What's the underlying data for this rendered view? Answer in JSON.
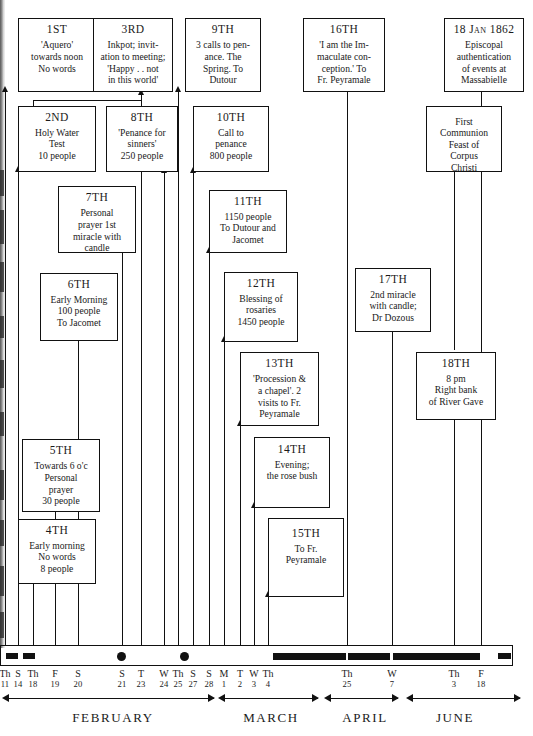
{
  "boxes": [
    {
      "name": "box-1st",
      "day": "1ST",
      "body": "'Aquero'\ntowards noon\nNo words"
    },
    {
      "name": "box-3rd",
      "day": "3RD",
      "body": "Inkpot; invit-\nation to meeting;\n'Happy . . not\nin this world'"
    },
    {
      "name": "box-9th",
      "day": "9TH",
      "body": "3 calls to pen-\nance. The\nSpring. To\nDutour"
    },
    {
      "name": "box-16th",
      "day": "16TH",
      "body": "'I am the Im-\nmaculate con-\nception.' To\nFr. Peyramale"
    },
    {
      "name": "box-18jan",
      "day": "18 Jan 1862",
      "body": "Episcopal\nauthentication\nof events at\nMassabielle"
    },
    {
      "name": "box-2nd",
      "day": "2ND",
      "body": "Holy Water\nTest\n10 people"
    },
    {
      "name": "box-8th",
      "day": "8TH",
      "body": "'Penance for\nsinners'\n250 people"
    },
    {
      "name": "box-10th",
      "day": "10TH",
      "body": "Call to\npenance\n800 people"
    },
    {
      "name": "box-first-communion",
      "day": "",
      "body": "First\nCommunion\nFeast of\nCorpus\nChristi"
    },
    {
      "name": "box-7th",
      "day": "7TH",
      "body": "Personal\nprayer 1st\nmiracle with\ncandle"
    },
    {
      "name": "box-11th",
      "day": "11TH",
      "body": "1150 people\nTo Dutour and\nJacomet"
    },
    {
      "name": "box-6th",
      "day": "6TH",
      "body": "Early Morning\n100 people\nTo Jacomet"
    },
    {
      "name": "box-12th",
      "day": "12TH",
      "body": "Blessing of\nrosaries\n1450 people"
    },
    {
      "name": "box-17th",
      "day": "17TH",
      "body": "2nd miracle\nwith candle;\nDr Dozous"
    },
    {
      "name": "box-13th",
      "day": "13TH",
      "body": "'Procession &\na chapel'. 2\nvisits to Fr.\nPeyramale"
    },
    {
      "name": "box-18th",
      "day": "18TH",
      "body": "8 pm\nRight bank\nof River Gave"
    },
    {
      "name": "box-14th",
      "day": "14TH",
      "body": "Evening;\nthe rose bush"
    },
    {
      "name": "box-5th",
      "day": "5TH",
      "body": "Towards 6 o'c\nPersonal\nprayer\n30 people"
    },
    {
      "name": "box-15th",
      "day": "15TH",
      "body": "To Fr.\nPeyramale"
    },
    {
      "name": "box-4th",
      "day": "4TH",
      "body": "Early morning\nNo words\n8 people"
    }
  ],
  "ticks": [
    {
      "dow": "Th",
      "num": "11"
    },
    {
      "dow": "S",
      "num": "14"
    },
    {
      "dow": "Th",
      "num": "18"
    },
    {
      "dow": "F",
      "num": "19"
    },
    {
      "dow": "S",
      "num": "20"
    },
    {
      "dow": "S",
      "num": "21"
    },
    {
      "dow": "T",
      "num": "23"
    },
    {
      "dow": "W",
      "num": "24"
    },
    {
      "dow": "Th",
      "num": "25"
    },
    {
      "dow": "S",
      "num": "27"
    },
    {
      "dow": "S",
      "num": "28"
    },
    {
      "dow": "M",
      "num": "1"
    },
    {
      "dow": "T",
      "num": "2"
    },
    {
      "dow": "W",
      "num": "3"
    },
    {
      "dow": "Th",
      "num": "4"
    },
    {
      "dow": "Th",
      "num": "25"
    },
    {
      "dow": "W",
      "num": "7"
    },
    {
      "dow": "Th",
      "num": "3"
    },
    {
      "dow": "F",
      "num": "18"
    }
  ],
  "months": [
    {
      "name": "FEBRUARY"
    },
    {
      "name": "MARCH"
    },
    {
      "name": "APRIL"
    },
    {
      "name": "JUNE"
    }
  ],
  "colors": {
    "ink": "#111111",
    "paper": "#ffffff"
  }
}
